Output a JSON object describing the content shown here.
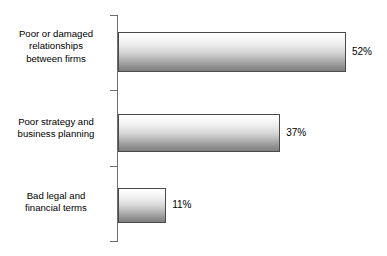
{
  "chart_data": {
    "type": "bar",
    "orientation": "horizontal",
    "title": "",
    "subtitle": "",
    "xlabel": "",
    "ylabel": "",
    "categories": [
      "Poor or damaged relationships between firms",
      "Poor strategy and business planning",
      "Bad legal and financial terms"
    ],
    "category_lines": [
      [
        "Poor or damaged",
        "relationships",
        "between firms"
      ],
      [
        "Poor strategy and",
        "business planning"
      ],
      [
        "Bad legal and",
        "financial terms"
      ]
    ],
    "values": [
      52,
      37,
      11
    ],
    "value_labels": [
      "52%",
      "37%",
      "11%"
    ],
    "xlim": [
      0,
      52
    ],
    "grid": false,
    "legend": false,
    "axis_line": "vertical category spine with ticks",
    "colors": {
      "bar_gradient_top": "#ffffff",
      "bar_gradient_bottom": "#7f7f7f",
      "bar_border": "#4a4a4a",
      "axis": "#6e6e6e",
      "text": "#000000",
      "background": "#ffffff"
    }
  }
}
